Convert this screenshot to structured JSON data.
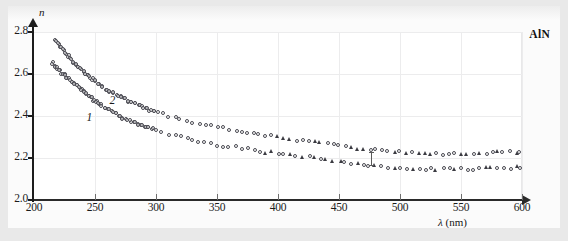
{
  "chart_data": {
    "type": "scatter",
    "title": "",
    "sample_label": "AlN",
    "xlabel": "λ (nm)",
    "ylabel": "n",
    "xlim": [
      200,
      600
    ],
    "ylim": [
      2.0,
      2.8
    ],
    "xticks": [
      200,
      250,
      300,
      350,
      400,
      450,
      500,
      550,
      600
    ],
    "yticks": [
      2.0,
      2.2,
      2.4,
      2.6,
      2.8
    ],
    "grid": true,
    "legend_position": "none",
    "curve_labels": [
      {
        "text": "1",
        "x": 243,
        "y": 2.385
      },
      {
        "text": "2",
        "x": 262,
        "y": 2.465
      }
    ],
    "annotations": [
      {
        "type": "errorbar",
        "x": 476,
        "y": 2.195,
        "yerr": 0.035
      }
    ],
    "series": [
      {
        "name": "1",
        "marker": "open-circle-and-filled-triangle",
        "points": [
          [
            215,
            2.655
          ],
          [
            217,
            2.64
          ],
          [
            219,
            2.628
          ],
          [
            221,
            2.616
          ],
          [
            223,
            2.604
          ],
          [
            225,
            2.596
          ],
          [
            227,
            2.586
          ],
          [
            229,
            2.575
          ],
          [
            231,
            2.564
          ],
          [
            233,
            2.556
          ],
          [
            235,
            2.545
          ],
          [
            237,
            2.536
          ],
          [
            239,
            2.526
          ],
          [
            241,
            2.516
          ],
          [
            243,
            2.505
          ],
          [
            245,
            2.495
          ],
          [
            247,
            2.487
          ],
          [
            249,
            2.477
          ],
          [
            251,
            2.468
          ],
          [
            253,
            2.46
          ],
          [
            255,
            2.452
          ],
          [
            258,
            2.44
          ],
          [
            261,
            2.43
          ],
          [
            264,
            2.42
          ],
          [
            267,
            2.41
          ],
          [
            270,
            2.4
          ],
          [
            273,
            2.392
          ],
          [
            276,
            2.385
          ],
          [
            279,
            2.377
          ],
          [
            282,
            2.37
          ],
          [
            285,
            2.363
          ],
          [
            288,
            2.356
          ],
          [
            291,
            2.35
          ],
          [
            294,
            2.344
          ],
          [
            297,
            2.338
          ],
          [
            300,
            2.332
          ],
          [
            305,
            2.323
          ],
          [
            310,
            2.315
          ],
          [
            315,
            2.307
          ],
          [
            320,
            2.3
          ],
          [
            325,
            2.293
          ],
          [
            330,
            2.287
          ],
          [
            335,
            2.281
          ],
          [
            340,
            2.275
          ],
          [
            345,
            2.27
          ],
          [
            350,
            2.265
          ],
          [
            355,
            2.26
          ],
          [
            360,
            2.255
          ],
          [
            365,
            2.251
          ],
          [
            370,
            2.247
          ],
          [
            375,
            2.243
          ],
          [
            380,
            2.239
          ],
          [
            385,
            2.235
          ],
          [
            390,
            2.231
          ],
          [
            395,
            2.228
          ],
          [
            400,
            2.224
          ],
          [
            405,
            2.22
          ],
          [
            410,
            2.216
          ],
          [
            415,
            2.212
          ],
          [
            420,
            2.208
          ],
          [
            425,
            2.204
          ],
          [
            430,
            2.2
          ],
          [
            435,
            2.196
          ],
          [
            440,
            2.191
          ],
          [
            445,
            2.187
          ],
          [
            450,
            2.183
          ],
          [
            455,
            2.18
          ],
          [
            460,
            2.176
          ],
          [
            465,
            2.172
          ],
          [
            470,
            2.168
          ],
          [
            475,
            2.164
          ],
          [
            480,
            2.161
          ],
          [
            485,
            2.159
          ],
          [
            490,
            2.157
          ],
          [
            495,
            2.155
          ],
          [
            500,
            2.153
          ],
          [
            505,
            2.152
          ],
          [
            510,
            2.151
          ],
          [
            515,
            2.15
          ],
          [
            520,
            2.149
          ],
          [
            525,
            2.148
          ],
          [
            530,
            2.146
          ],
          [
            535,
            2.145
          ],
          [
            540,
            2.145
          ],
          [
            545,
            2.146
          ],
          [
            550,
            2.147
          ],
          [
            555,
            2.148
          ],
          [
            560,
            2.149
          ],
          [
            565,
            2.15
          ],
          [
            570,
            2.151
          ],
          [
            575,
            2.152
          ],
          [
            580,
            2.153
          ],
          [
            585,
            2.154
          ],
          [
            590,
            2.155
          ],
          [
            595,
            2.156
          ],
          [
            598,
            2.157
          ]
        ]
      },
      {
        "name": "2",
        "marker": "open-circle-and-filled-triangle",
        "points": [
          [
            218,
            2.76
          ],
          [
            220,
            2.745
          ],
          [
            222,
            2.73
          ],
          [
            224,
            2.714
          ],
          [
            226,
            2.7
          ],
          [
            228,
            2.686
          ],
          [
            230,
            2.672
          ],
          [
            232,
            2.66
          ],
          [
            234,
            2.648
          ],
          [
            236,
            2.636
          ],
          [
            238,
            2.625
          ],
          [
            240,
            2.614
          ],
          [
            242,
            2.604
          ],
          [
            244,
            2.594
          ],
          [
            246,
            2.584
          ],
          [
            248,
            2.575
          ],
          [
            250,
            2.566
          ],
          [
            253,
            2.553
          ],
          [
            256,
            2.541
          ],
          [
            259,
            2.53
          ],
          [
            262,
            2.519
          ],
          [
            265,
            2.509
          ],
          [
            268,
            2.499
          ],
          [
            271,
            2.49
          ],
          [
            274,
            2.481
          ],
          [
            277,
            2.473
          ],
          [
            280,
            2.465
          ],
          [
            283,
            2.457
          ],
          [
            286,
            2.45
          ],
          [
            289,
            2.443
          ],
          [
            292,
            2.436
          ],
          [
            295,
            2.43
          ],
          [
            298,
            2.424
          ],
          [
            301,
            2.418
          ],
          [
            305,
            2.41
          ],
          [
            310,
            2.401
          ],
          [
            315,
            2.393
          ],
          [
            320,
            2.385
          ],
          [
            325,
            2.378
          ],
          [
            330,
            2.371
          ],
          [
            335,
            2.364
          ],
          [
            340,
            2.358
          ],
          [
            345,
            2.352
          ],
          [
            350,
            2.346
          ],
          [
            355,
            2.341
          ],
          [
            360,
            2.336
          ],
          [
            365,
            2.331
          ],
          [
            370,
            2.326
          ],
          [
            375,
            2.322
          ],
          [
            380,
            2.318
          ],
          [
            385,
            2.313
          ],
          [
            390,
            2.309
          ],
          [
            395,
            2.305
          ],
          [
            400,
            2.301
          ],
          [
            405,
            2.297
          ],
          [
            410,
            2.293
          ],
          [
            415,
            2.289
          ],
          [
            420,
            2.285
          ],
          [
            425,
            2.281
          ],
          [
            430,
            2.277
          ],
          [
            435,
            2.273
          ],
          [
            440,
            2.269
          ],
          [
            445,
            2.265
          ],
          [
            450,
            2.261
          ],
          [
            455,
            2.257
          ],
          [
            460,
            2.252
          ],
          [
            465,
            2.248
          ],
          [
            470,
            2.244
          ],
          [
            475,
            2.24
          ],
          [
            480,
            2.236
          ],
          [
            485,
            2.233
          ],
          [
            490,
            2.23
          ],
          [
            495,
            2.228
          ],
          [
            500,
            2.226
          ],
          [
            505,
            2.225
          ],
          [
            510,
            2.224
          ],
          [
            515,
            2.223
          ],
          [
            520,
            2.222
          ],
          [
            525,
            2.221
          ],
          [
            530,
            2.22
          ],
          [
            535,
            2.219
          ],
          [
            540,
            2.219
          ],
          [
            545,
            2.22
          ],
          [
            550,
            2.221
          ],
          [
            555,
            2.222
          ],
          [
            560,
            2.223
          ],
          [
            565,
            2.224
          ],
          [
            570,
            2.225
          ],
          [
            575,
            2.226
          ],
          [
            580,
            2.227
          ],
          [
            585,
            2.228
          ],
          [
            590,
            2.229
          ],
          [
            595,
            2.23
          ],
          [
            598,
            2.231
          ]
        ]
      }
    ]
  }
}
